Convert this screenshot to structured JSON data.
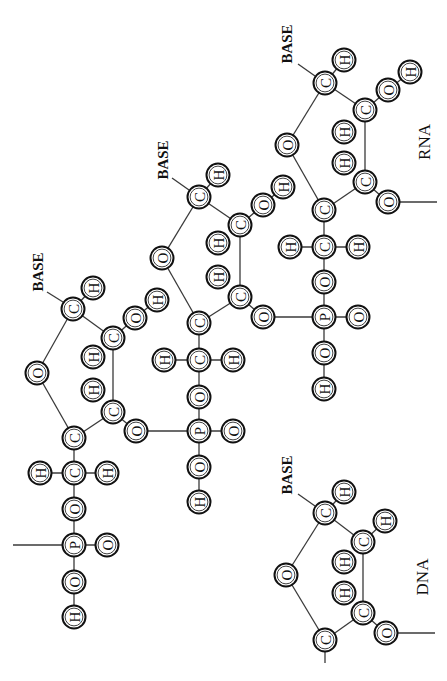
{
  "diagram": {
    "orientation": "rotated -90deg",
    "colors": {
      "ink": "#111111",
      "bond": "#3a3a3a",
      "background": "#ffffff"
    },
    "labels": [
      {
        "id": "base-1",
        "text": "BASE",
        "x": 38,
        "y": 272,
        "kind": "base"
      },
      {
        "id": "base-2",
        "text": "BASE",
        "x": 163,
        "y": 160,
        "kind": "base"
      },
      {
        "id": "base-3",
        "text": "BASE",
        "x": 287,
        "y": 44,
        "kind": "base"
      },
      {
        "id": "base-dna",
        "text": "BASE",
        "x": 287,
        "y": 475,
        "kind": "base"
      },
      {
        "id": "rna-label",
        "text": "RNA",
        "x": 424,
        "y": 142,
        "kind": "tag"
      },
      {
        "id": "dna-label",
        "text": "DNA",
        "x": 422,
        "y": 577,
        "kind": "tag"
      }
    ],
    "atoms": [
      {
        "id": "u1-c1",
        "el": "C",
        "x": 73,
        "y": 309
      },
      {
        "id": "u1-h1",
        "el": "H",
        "x": 93,
        "y": 288
      },
      {
        "id": "u1-o4",
        "el": "O",
        "x": 37,
        "y": 373
      },
      {
        "id": "u1-c2",
        "el": "C",
        "x": 113,
        "y": 338
      },
      {
        "id": "u1-o2",
        "el": "O",
        "x": 135,
        "y": 318
      },
      {
        "id": "u1-h2o",
        "el": "H",
        "x": 157,
        "y": 300
      },
      {
        "id": "u1-h2",
        "el": "H",
        "x": 93,
        "y": 357
      },
      {
        "id": "u1-h3",
        "el": "H",
        "x": 93,
        "y": 390
      },
      {
        "id": "u1-c3",
        "el": "C",
        "x": 113,
        "y": 412
      },
      {
        "id": "u1-o3",
        "el": "O",
        "x": 136,
        "y": 431
      },
      {
        "id": "u1-c4",
        "el": "C",
        "x": 74,
        "y": 438
      },
      {
        "id": "u1-c5",
        "el": "C",
        "x": 74,
        "y": 473
      },
      {
        "id": "u1-h5a",
        "el": "H",
        "x": 40,
        "y": 473
      },
      {
        "id": "u1-h5b",
        "el": "H",
        "x": 107,
        "y": 473
      },
      {
        "id": "u1-o5",
        "el": "O",
        "x": 74,
        "y": 509
      },
      {
        "id": "u1-p",
        "el": "P",
        "x": 74,
        "y": 545
      },
      {
        "id": "u1-op",
        "el": "O",
        "x": 107,
        "y": 545
      },
      {
        "id": "u1-oh",
        "el": "O",
        "x": 74,
        "y": 582
      },
      {
        "id": "u1-hh",
        "el": "H",
        "x": 74,
        "y": 617
      },
      {
        "id": "u2-c1",
        "el": "C",
        "x": 199,
        "y": 197
      },
      {
        "id": "u2-h1",
        "el": "H",
        "x": 218,
        "y": 175
      },
      {
        "id": "u2-o4",
        "el": "O",
        "x": 162,
        "y": 258
      },
      {
        "id": "u2-c2",
        "el": "C",
        "x": 240,
        "y": 225
      },
      {
        "id": "u2-o2",
        "el": "O",
        "x": 263,
        "y": 205
      },
      {
        "id": "u2-h2o",
        "el": "H",
        "x": 283,
        "y": 187
      },
      {
        "id": "u2-h2",
        "el": "H",
        "x": 218,
        "y": 243
      },
      {
        "id": "u2-h3",
        "el": "H",
        "x": 218,
        "y": 277
      },
      {
        "id": "u2-c3",
        "el": "C",
        "x": 240,
        "y": 297
      },
      {
        "id": "u2-o3",
        "el": "O",
        "x": 263,
        "y": 317
      },
      {
        "id": "u2-c4",
        "el": "C",
        "x": 199,
        "y": 323
      },
      {
        "id": "u2-c5",
        "el": "C",
        "x": 199,
        "y": 360
      },
      {
        "id": "u2-h5a",
        "el": "H",
        "x": 164,
        "y": 360
      },
      {
        "id": "u2-h5b",
        "el": "H",
        "x": 233,
        "y": 360
      },
      {
        "id": "u2-o5",
        "el": "O",
        "x": 199,
        "y": 397
      },
      {
        "id": "u2-p",
        "el": "P",
        "x": 199,
        "y": 431
      },
      {
        "id": "u2-op",
        "el": "O",
        "x": 233,
        "y": 431
      },
      {
        "id": "u2-oh",
        "el": "O",
        "x": 199,
        "y": 467
      },
      {
        "id": "u2-hh",
        "el": "H",
        "x": 199,
        "y": 502
      },
      {
        "id": "u3-c1",
        "el": "C",
        "x": 325,
        "y": 83
      },
      {
        "id": "u3-h1",
        "el": "H",
        "x": 344,
        "y": 60
      },
      {
        "id": "u3-o4",
        "el": "O",
        "x": 287,
        "y": 145
      },
      {
        "id": "u3-c2",
        "el": "C",
        "x": 365,
        "y": 110
      },
      {
        "id": "u3-o2",
        "el": "O",
        "x": 388,
        "y": 90
      },
      {
        "id": "u3-h2o",
        "el": "H",
        "x": 410,
        "y": 72
      },
      {
        "id": "u3-h2",
        "el": "H",
        "x": 344,
        "y": 132
      },
      {
        "id": "u3-h3",
        "el": "H",
        "x": 344,
        "y": 163
      },
      {
        "id": "u3-c3",
        "el": "C",
        "x": 365,
        "y": 182
      },
      {
        "id": "u3-o3",
        "el": "O",
        "x": 388,
        "y": 202
      },
      {
        "id": "u3-c4",
        "el": "C",
        "x": 324,
        "y": 210
      },
      {
        "id": "u3-c5",
        "el": "C",
        "x": 324,
        "y": 247
      },
      {
        "id": "u3-h5a",
        "el": "H",
        "x": 290,
        "y": 247
      },
      {
        "id": "u3-h5b",
        "el": "H",
        "x": 358,
        "y": 247
      },
      {
        "id": "u3-o5",
        "el": "O",
        "x": 324,
        "y": 282
      },
      {
        "id": "u3-p",
        "el": "P",
        "x": 324,
        "y": 317
      },
      {
        "id": "u3-op",
        "el": "O",
        "x": 358,
        "y": 317
      },
      {
        "id": "u3-oh",
        "el": "O",
        "x": 324,
        "y": 353
      },
      {
        "id": "u3-hh",
        "el": "H",
        "x": 324,
        "y": 389
      },
      {
        "id": "d-c1",
        "el": "C",
        "x": 325,
        "y": 513
      },
      {
        "id": "d-h1",
        "el": "H",
        "x": 344,
        "y": 492
      },
      {
        "id": "d-o4",
        "el": "O",
        "x": 286,
        "y": 575
      },
      {
        "id": "d-c2",
        "el": "C",
        "x": 363,
        "y": 542
      },
      {
        "id": "d-h2b",
        "el": "H",
        "x": 385,
        "y": 521
      },
      {
        "id": "d-h2",
        "el": "H",
        "x": 344,
        "y": 562
      },
      {
        "id": "d-h3",
        "el": "H",
        "x": 344,
        "y": 593
      },
      {
        "id": "d-c3",
        "el": "C",
        "x": 363,
        "y": 613
      },
      {
        "id": "d-o3",
        "el": "O",
        "x": 386,
        "y": 633
      },
      {
        "id": "d-c4",
        "el": "C",
        "x": 325,
        "y": 640
      }
    ],
    "bonds": [
      [
        "u1-c1",
        "u1-h1"
      ],
      [
        "u1-c1",
        "u1-o4"
      ],
      [
        "u1-c1",
        "u1-c2"
      ],
      [
        "u1-c2",
        "u1-o2"
      ],
      [
        "u1-o2",
        "u1-h2o"
      ],
      [
        "u1-c2",
        "u1-c3"
      ],
      [
        "u1-o4",
        "u1-c4"
      ],
      [
        "u1-c3",
        "u1-c4"
      ],
      [
        "u1-c3",
        "u1-o3"
      ],
      [
        "u1-c4",
        "u1-c5"
      ],
      [
        "u1-c5",
        "u1-h5a"
      ],
      [
        "u1-c5",
        "u1-h5b"
      ],
      [
        "u1-c5",
        "u1-o5"
      ],
      [
        "u1-o5",
        "u1-p"
      ],
      [
        "u1-p",
        "u1-op"
      ],
      [
        "u1-p",
        "u1-oh"
      ],
      [
        "u1-oh",
        "u1-hh"
      ],
      [
        "u1-o3",
        "u2-p"
      ],
      [
        "u2-c1",
        "u2-h1"
      ],
      [
        "u2-c1",
        "u2-o4"
      ],
      [
        "u2-c1",
        "u2-c2"
      ],
      [
        "u2-c2",
        "u2-o2"
      ],
      [
        "u2-o2",
        "u2-h2o"
      ],
      [
        "u2-c2",
        "u2-c3"
      ],
      [
        "u2-o4",
        "u2-c4"
      ],
      [
        "u2-c3",
        "u2-c4"
      ],
      [
        "u2-c3",
        "u2-o3"
      ],
      [
        "u2-c4",
        "u2-c5"
      ],
      [
        "u2-c5",
        "u2-h5a"
      ],
      [
        "u2-c5",
        "u2-h5b"
      ],
      [
        "u2-c5",
        "u2-o5"
      ],
      [
        "u2-o5",
        "u2-p"
      ],
      [
        "u2-p",
        "u2-op"
      ],
      [
        "u2-p",
        "u2-oh"
      ],
      [
        "u2-oh",
        "u2-hh"
      ],
      [
        "u2-o3",
        "u3-p"
      ],
      [
        "u3-c1",
        "u3-h1"
      ],
      [
        "u3-c1",
        "u3-o4"
      ],
      [
        "u3-c1",
        "u3-c2"
      ],
      [
        "u3-c2",
        "u3-o2"
      ],
      [
        "u3-o2",
        "u3-h2o"
      ],
      [
        "u3-c2",
        "u3-c3"
      ],
      [
        "u3-o4",
        "u3-c4"
      ],
      [
        "u3-c3",
        "u3-c4"
      ],
      [
        "u3-c3",
        "u3-o3"
      ],
      [
        "u3-c4",
        "u3-c5"
      ],
      [
        "u3-c5",
        "u3-h5a"
      ],
      [
        "u3-c5",
        "u3-h5b"
      ],
      [
        "u3-c5",
        "u3-o5"
      ],
      [
        "u3-o5",
        "u3-p"
      ],
      [
        "u3-p",
        "u3-op"
      ],
      [
        "u3-p",
        "u3-oh"
      ],
      [
        "u3-oh",
        "u3-hh"
      ],
      [
        "d-c1",
        "d-h1"
      ],
      [
        "d-c1",
        "d-o4"
      ],
      [
        "d-c1",
        "d-c2"
      ],
      [
        "d-c2",
        "d-h2b"
      ],
      [
        "d-c2",
        "d-c3"
      ],
      [
        "d-o4",
        "d-c4"
      ],
      [
        "d-c3",
        "d-c4"
      ],
      [
        "d-c3",
        "d-o3"
      ]
    ],
    "free_lines": [
      {
        "id": "u1-p-left-stub",
        "x1": 13,
        "y1": 545,
        "x2": 62,
        "y2": 545
      },
      {
        "id": "u3-o3-right-stub",
        "x1": 399,
        "y1": 202,
        "x2": 437,
        "y2": 202
      },
      {
        "id": "d-o3-right-stub",
        "x1": 397,
        "y1": 633,
        "x2": 435,
        "y2": 633
      },
      {
        "id": "d-c4-down-stub",
        "x1": 325,
        "y1": 652,
        "x2": 325,
        "y2": 663
      },
      {
        "id": "base-1-link",
        "x1": 47,
        "y1": 292,
        "x2": 63,
        "y2": 302
      },
      {
        "id": "base-2-link",
        "x1": 172,
        "y1": 178,
        "x2": 189,
        "y2": 190
      },
      {
        "id": "base-3-link",
        "x1": 298,
        "y1": 64,
        "x2": 315,
        "y2": 76
      },
      {
        "id": "base-dna-link",
        "x1": 298,
        "y1": 494,
        "x2": 315,
        "y2": 506
      }
    ]
  }
}
